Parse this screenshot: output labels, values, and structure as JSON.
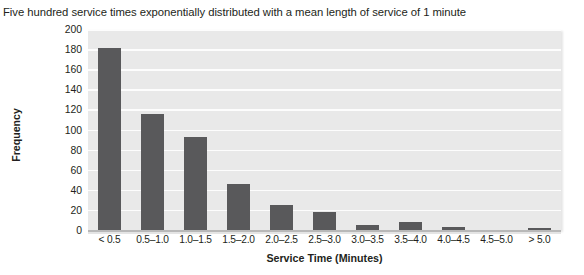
{
  "caption": "Five hundred service times exponentially distributed with a mean length of service of 1 minute",
  "chart_data": {
    "type": "bar",
    "title": "Five hundred service times exponentially distributed with a mean length of service of 1 minute",
    "xlabel": "Service Time (Minutes)",
    "ylabel": "Frequency",
    "categories": [
      "< 0.5",
      "0.5–1.0",
      "1.0–1.5",
      "1.5–2.0",
      "2.0–2.5",
      "2.5–3.0",
      "3.0–3.5",
      "3.5–4.0",
      "4.0–4.5",
      "4.5–5.0",
      "> 5.0"
    ],
    "values": [
      181,
      115,
      93,
      46,
      25,
      18,
      5,
      8,
      3,
      0,
      2
    ],
    "ylim": [
      0,
      200
    ],
    "yticks": [
      0,
      20,
      40,
      60,
      80,
      100,
      120,
      140,
      160,
      180,
      200
    ],
    "ytick_labels": [
      "0",
      "20",
      "40",
      "60",
      "80",
      "100",
      "120",
      "140",
      "160",
      "180",
      "200"
    ],
    "grid": "horizontal",
    "legend": "none",
    "bar_color": "#59595b",
    "plot_background": "#e9e9e9",
    "gridline_color": "#fdfdfd"
  }
}
